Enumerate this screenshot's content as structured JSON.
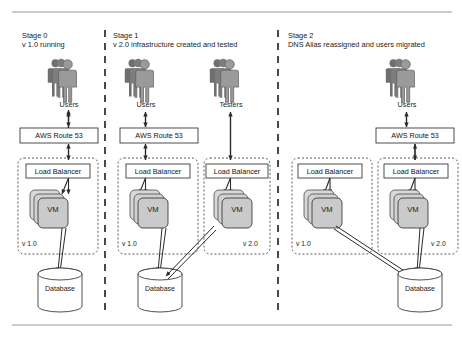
{
  "diagram": {
    "colors": {
      "rule": "#9a9a9a",
      "separator": "#2b2b2b",
      "box_border": "#3a3a3a",
      "group_border": "#4a4a4a",
      "vm_fill": "#c9c9c9",
      "vm_stack_fill": "#d6d6d6",
      "person_fill": "#8f8f8f",
      "person_dark": "#6f6f6f",
      "db_fill": "#ffffff",
      "arrow": "#2a2a2a",
      "text": "#1b1b1b"
    },
    "rules": {
      "top_y": 12,
      "bottom_y": 325
    },
    "separators": [
      {
        "name": "separator-stage0-stage1",
        "x": 105
      },
      {
        "name": "separator-stage1-stage2",
        "x": 278
      }
    ],
    "stages": [
      {
        "id": "stage-0",
        "title": "Stage 0",
        "subtitle": "v 1.0 running",
        "actors": [
          {
            "name": "users",
            "label": "Users",
            "x": 60,
            "y": 58
          }
        ],
        "dns": {
          "label": "AWS Route 53",
          "x": 20,
          "y": 128,
          "w": 78,
          "h": 15
        },
        "groups": [
          {
            "name": "group-v1",
            "version": "v 1.0",
            "lb_label": "Load Balancer",
            "vm_label": "VM",
            "x": 18,
            "y": 158,
            "w": 80,
            "h": 96
          }
        ],
        "databases": [
          {
            "label": "Database",
            "x": 38,
            "y": 268,
            "w": 44,
            "h": 44
          }
        ]
      },
      {
        "id": "stage-1",
        "title": "Stage 1",
        "subtitle": "v 2.0 infrastructure created and tested",
        "actors": [
          {
            "name": "users",
            "label": "Users",
            "x": 137,
            "y": 58
          },
          {
            "name": "testers",
            "label": "Testers",
            "x": 222,
            "y": 58
          }
        ],
        "dns": {
          "label": "AWS Route 53",
          "x": 120,
          "y": 128,
          "w": 78,
          "h": 15
        },
        "groups": [
          {
            "name": "group-v1",
            "version": "v 1.0",
            "lb_label": "Load Balancer",
            "vm_label": "VM",
            "x": 118,
            "y": 158,
            "w": 80,
            "h": 96
          },
          {
            "name": "group-v2",
            "version": "v 2.0",
            "lb_label": "Load Balancer",
            "vm_label": "VM",
            "x": 204,
            "y": 158,
            "w": 66,
            "h": 96
          }
        ],
        "databases": [
          {
            "label": "Database",
            "x": 138,
            "y": 268,
            "w": 44,
            "h": 44
          }
        ]
      },
      {
        "id": "stage-2",
        "title": "Stage 2",
        "subtitle": "DNS Alias reassigned and users migrated",
        "actors": [
          {
            "name": "users",
            "label": "Users",
            "x": 398,
            "y": 58
          }
        ],
        "dns": {
          "label": "AWS Route 53",
          "x": 376,
          "y": 128,
          "w": 78,
          "h": 15
        },
        "groups": [
          {
            "name": "group-v1",
            "version": "v 1.0",
            "lb_label": "Load Balancer",
            "vm_label": "VM",
            "x": 292,
            "y": 158,
            "w": 80,
            "h": 96
          },
          {
            "name": "group-v2",
            "version": "v 2.0",
            "lb_label": "Load Balancer",
            "vm_label": "VM",
            "x": 378,
            "y": 158,
            "w": 80,
            "h": 96
          }
        ],
        "databases": [
          {
            "label": "Database",
            "x": 398,
            "y": 268,
            "w": 44,
            "h": 44
          }
        ]
      }
    ]
  }
}
